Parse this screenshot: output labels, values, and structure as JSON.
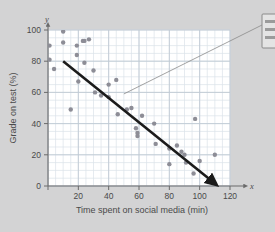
{
  "chart_data": {
    "type": "scatter",
    "title": "",
    "xlabel": "Time spent on social media (min)",
    "ylabel": "Grade on test (%)",
    "xlim": [
      0,
      120
    ],
    "ylim": [
      0,
      100
    ],
    "x_ticks": [
      0,
      20,
      40,
      60,
      80,
      100,
      120
    ],
    "y_ticks": [
      0,
      20,
      40,
      60,
      80,
      100
    ],
    "x_minor_step": 5,
    "y_minor_step": 5,
    "grid": true,
    "legend": "none",
    "x_axis_letter": "x",
    "y_axis_letter": "y",
    "point_color": "#8d8d96",
    "trendline_color": "#1b1b1b",
    "grid_color": "#c3cdd6",
    "background_color": "#d3d3d4",
    "plot_background_color": "#ffffff",
    "points": [
      {
        "x": 1,
        "y": 102
      },
      {
        "x": 1,
        "y": 90
      },
      {
        "x": 1,
        "y": 81
      },
      {
        "x": 4,
        "y": 75
      },
      {
        "x": 10,
        "y": 99
      },
      {
        "x": 10,
        "y": 92
      },
      {
        "x": 15,
        "y": 49
      },
      {
        "x": 19,
        "y": 90
      },
      {
        "x": 19,
        "y": 84
      },
      {
        "x": 20,
        "y": 67
      },
      {
        "x": 23,
        "y": 93
      },
      {
        "x": 24,
        "y": 93
      },
      {
        "x": 24,
        "y": 79
      },
      {
        "x": 27,
        "y": 94
      },
      {
        "x": 30,
        "y": 74
      },
      {
        "x": 31,
        "y": 60
      },
      {
        "x": 35,
        "y": 58
      },
      {
        "x": 40,
        "y": 65
      },
      {
        "x": 40,
        "y": 57
      },
      {
        "x": 45,
        "y": 68
      },
      {
        "x": 46,
        "y": 46
      },
      {
        "x": 52,
        "y": 49
      },
      {
        "x": 55,
        "y": 50
      },
      {
        "x": 58,
        "y": 37
      },
      {
        "x": 59,
        "y": 34
      },
      {
        "x": 59,
        "y": 32
      },
      {
        "x": 62,
        "y": 45
      },
      {
        "x": 70,
        "y": 40
      },
      {
        "x": 71,
        "y": 27
      },
      {
        "x": 80,
        "y": 24
      },
      {
        "x": 80,
        "y": 14
      },
      {
        "x": 85,
        "y": 26
      },
      {
        "x": 88,
        "y": 22
      },
      {
        "x": 90,
        "y": 20
      },
      {
        "x": 91,
        "y": 15
      },
      {
        "x": 96,
        "y": 8
      },
      {
        "x": 97,
        "y": 43
      },
      {
        "x": 100,
        "y": 16
      },
      {
        "x": 110,
        "y": 20
      }
    ],
    "trendline": {
      "x_start": 10,
      "y_start": 80,
      "x_end": 107,
      "y_end": 4,
      "arrow": true
    },
    "callout": {
      "leader_from_x": 50,
      "leader_from_y": 59,
      "text_line_1": "",
      "text_line_2": ""
    }
  }
}
